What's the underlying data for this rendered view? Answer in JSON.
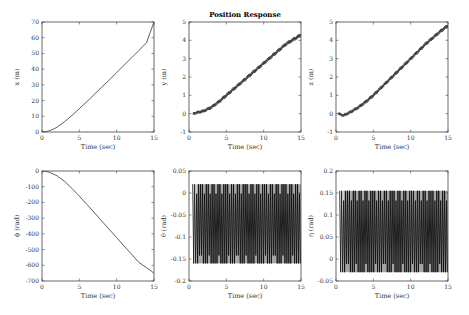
{
  "figure": {
    "title": "Position Response"
  },
  "chart_data": [
    {
      "type": "line",
      "panel": "top-left",
      "title": "",
      "xlabel": "Time (sec)",
      "ylabel": "x (m)",
      "xlim": [
        0,
        15
      ],
      "ylim": [
        0,
        70
      ],
      "xticks": [
        0,
        5,
        10,
        15
      ],
      "yticks": [
        0,
        10,
        20,
        30,
        40,
        50,
        60,
        70
      ],
      "grid": false,
      "series": [
        {
          "name": "x",
          "x": [
            0,
            0.5,
            1,
            1.5,
            2,
            3,
            4,
            5,
            6,
            7,
            8,
            9,
            10,
            11,
            12,
            13,
            14,
            15
          ],
          "y": [
            0,
            0.2,
            0.8,
            1.8,
            3,
            6.5,
            10.5,
            14.8,
            19.3,
            23.9,
            28.5,
            33.1,
            37.8,
            42.5,
            47.2,
            52,
            56.8,
            70
          ]
        }
      ]
    },
    {
      "type": "line",
      "panel": "top-middle",
      "title": "Position Response",
      "xlabel": "Time (sec)",
      "ylabel": "y (m)",
      "xlim": [
        0,
        15
      ],
      "ylim": [
        -1,
        5
      ],
      "xticks": [
        0,
        5,
        10,
        15
      ],
      "yticks": [
        -1,
        0,
        1,
        2,
        3,
        4,
        5
      ],
      "grid": false,
      "series": [
        {
          "name": "y",
          "x": [
            0.5,
            1,
            2,
            3,
            4,
            5,
            6,
            7,
            8,
            9,
            10,
            11,
            12,
            13,
            14,
            15
          ],
          "y": [
            0,
            0.05,
            0.15,
            0.35,
            0.65,
            1.0,
            1.35,
            1.7,
            2.05,
            2.4,
            2.75,
            3.1,
            3.45,
            3.8,
            4.05,
            4.3
          ]
        }
      ]
    },
    {
      "type": "line",
      "panel": "top-right",
      "title": "",
      "xlabel": "Time (sec)",
      "ylabel": "z (m)",
      "xlim": [
        0,
        15
      ],
      "ylim": [
        -1,
        5
      ],
      "xticks": [
        0,
        5,
        10,
        15
      ],
      "yticks": [
        -1,
        0,
        1,
        2,
        3,
        4,
        5
      ],
      "grid": false,
      "series": [
        {
          "name": "z",
          "x": [
            0.3,
            1,
            2,
            3,
            4,
            5,
            6,
            7,
            8,
            9,
            10,
            11,
            12,
            13,
            14,
            15
          ],
          "y": [
            0,
            -0.1,
            0.1,
            0.35,
            0.65,
            1.0,
            1.4,
            1.8,
            2.2,
            2.6,
            3.0,
            3.4,
            3.8,
            4.15,
            4.5,
            4.8
          ]
        }
      ]
    },
    {
      "type": "line",
      "panel": "bottom-left",
      "title": "",
      "xlabel": "Time (sec)",
      "ylabel": "ϕ (rad)",
      "xlim": [
        0,
        15
      ],
      "ylim": [
        -700,
        0
      ],
      "xticks": [
        0,
        5,
        10,
        15
      ],
      "yticks": [
        0,
        -100,
        -200,
        -300,
        -400,
        -500,
        -600,
        -700
      ],
      "grid": false,
      "series": [
        {
          "name": "phi",
          "x": [
            0,
            0.5,
            1,
            2,
            3,
            4,
            5,
            6,
            7,
            8,
            9,
            10,
            11,
            12,
            13,
            14,
            15
          ],
          "y": [
            0,
            -2,
            -8,
            -30,
            -65,
            -110,
            -160,
            -212,
            -265,
            -318,
            -371,
            -424,
            -477,
            -530,
            -583,
            -615,
            -650
          ]
        }
      ]
    },
    {
      "type": "line",
      "panel": "bottom-middle",
      "title": "",
      "xlabel": "Time (sec)",
      "ylabel": "θ (rad)",
      "xlim": [
        0,
        15
      ],
      "ylim": [
        -0.2,
        0.05
      ],
      "xticks": [
        0,
        5,
        10,
        15
      ],
      "yticks": [
        0.05,
        0,
        -0.05,
        -0.1,
        -0.15,
        -0.2
      ],
      "grid": false,
      "series": [
        {
          "name": "theta",
          "description": "high-frequency oscillation between approx 0.02 and -0.16 from t≈0.5 to 15",
          "upper": 0.02,
          "lower": -0.16,
          "start": 0.5,
          "end": 15
        }
      ]
    },
    {
      "type": "line",
      "panel": "bottom-right",
      "title": "",
      "xlabel": "Time (sec)",
      "ylabel": "η (rad)",
      "xlim": [
        0,
        15
      ],
      "ylim": [
        -0.05,
        0.2
      ],
      "xticks": [
        0,
        5,
        10,
        15
      ],
      "yticks": [
        0.2,
        0.15,
        0.1,
        0.05,
        0,
        -0.05
      ],
      "grid": false,
      "series": [
        {
          "name": "eta",
          "description": "high-frequency oscillation between approx 0.155 and -0.03 from t≈0.5 to 15",
          "upper": 0.155,
          "lower": -0.03,
          "start": 0.5,
          "end": 15
        }
      ]
    }
  ]
}
